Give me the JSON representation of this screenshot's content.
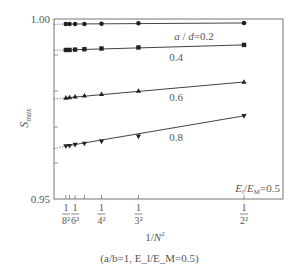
{
  "chart_data": {
    "type": "line",
    "title": "",
    "xlabel": "1/N²",
    "ylabel": "S_max",
    "caption": "(a/b=1,  E_l/E_M=0.5)",
    "annotation": "E_l/E_M=0.5",
    "xlim": [
      0,
      0.3684
    ],
    "ylim": [
      0.95,
      1.0
    ],
    "yticks": [
      {
        "value": 1.0,
        "label": "1.00"
      },
      {
        "value": 0.95,
        "label": "0.95"
      }
    ],
    "y_minor_ticks": [
      0.96,
      0.97,
      0.98,
      0.99
    ],
    "xticks": [
      {
        "N": 8,
        "value": 0.015625,
        "label_num": "1",
        "label_den": "8²"
      },
      {
        "N": 7,
        "value": 0.020408,
        "label_num": "",
        "label_den": ""
      },
      {
        "N": 6,
        "value": 0.027778,
        "label_num": "1",
        "label_den": "6²"
      },
      {
        "N": 5,
        "value": 0.04,
        "label_num": "",
        "label_den": ""
      },
      {
        "N": 4,
        "value": 0.0625,
        "label_num": "1",
        "label_den": "4²"
      },
      {
        "N": 3,
        "value": 0.111111,
        "label_num": "1",
        "label_den": "3²"
      },
      {
        "N": 2,
        "value": 0.25,
        "label_num": "1",
        "label_den": "2²"
      }
    ],
    "x": [
      0.015625,
      0.020408,
      0.027778,
      0.04,
      0.0625,
      0.111111,
      0.25
    ],
    "series": [
      {
        "name": "a/d=0.2",
        "label": "a/d=0.2",
        "marker": "circle",
        "values": [
          0.9986,
          0.9986,
          0.9986,
          0.9986,
          0.9987,
          0.9988,
          0.9989
        ],
        "extrapolated_y0": 0.9985
      },
      {
        "name": "a/d=0.4",
        "label": "0.4",
        "marker": "square",
        "values": [
          0.9914,
          0.9914,
          0.9915,
          0.9916,
          0.9918,
          0.9921,
          0.9928
        ],
        "extrapolated_y0": 0.9913
      },
      {
        "name": "a/d=0.6",
        "label": "0.6",
        "marker": "triangle-up",
        "values": [
          0.9781,
          0.9782,
          0.9784,
          0.9787,
          0.9791,
          0.98,
          0.9825
        ],
        "extrapolated_y0": 0.9778
      },
      {
        "name": "a/d=0.8",
        "label": "0.8",
        "marker": "triangle-down",
        "values": [
          0.9647,
          0.9648,
          0.9651,
          0.9654,
          0.966,
          0.9674,
          0.9731
        ],
        "extrapolated_y0": 0.964
      }
    ],
    "grid": false,
    "legend": "inline labels"
  },
  "labels": {
    "ytick_top": "1.00",
    "ytick_bottom": "0.95",
    "ylabel_main": "S",
    "ylabel_sub": "max",
    "xlabel_main": "1/",
    "xlabel_N": "N",
    "xlabel_sup": "2",
    "series_0": "a/d=0.2",
    "series_1": "0.4",
    "series_2": "0.6",
    "series_3": "0.8",
    "annotation": "E_l/E_M=0.5",
    "caption": "(a/b=1,  E_l/E_M=0.5)"
  }
}
